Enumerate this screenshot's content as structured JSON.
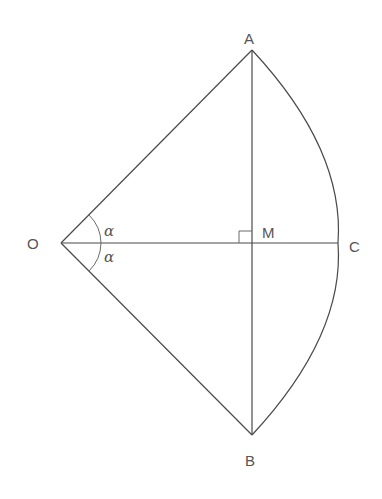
{
  "diagram": {
    "points": {
      "O": {
        "label": "O"
      },
      "A": {
        "label": "A"
      },
      "B": {
        "label": "B"
      },
      "M": {
        "label": "M"
      },
      "C": {
        "label": "C"
      }
    },
    "angles": {
      "upper": {
        "label": "α"
      },
      "lower": {
        "label": "α"
      }
    },
    "segments": [
      "OA",
      "OB",
      "OC",
      "AB"
    ],
    "arcs": [
      "arc-AB-through-C"
    ],
    "markers": [
      "right-angle-at-M"
    ],
    "colors": {
      "stroke": "#4a4a4a",
      "text": "#555555",
      "background": "#ffffff"
    }
  }
}
